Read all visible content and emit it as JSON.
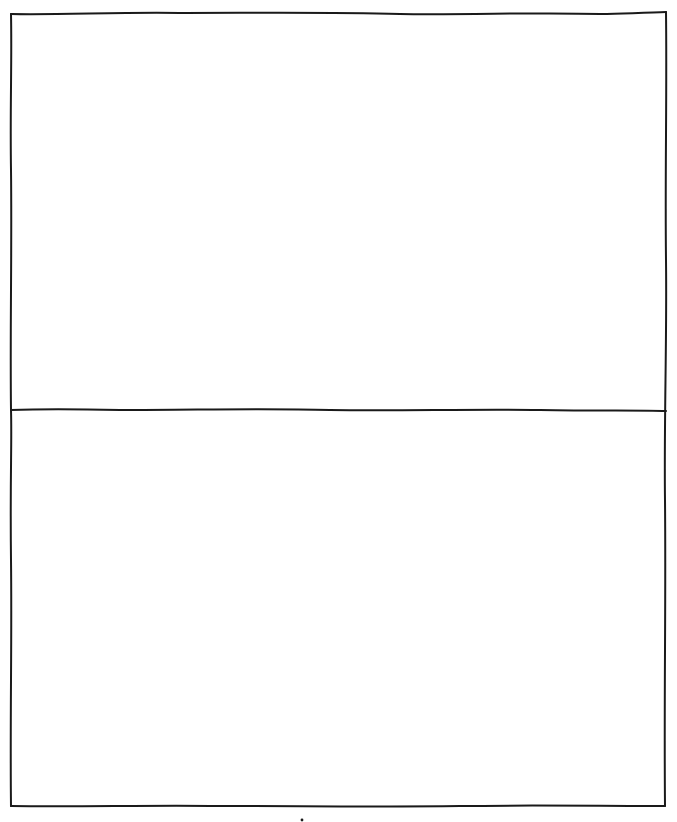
{
  "sketch": {
    "description": "Hand-drawn outline frame split into two empty stacked panels",
    "stroke_color": "#1a1a1a",
    "background_color": "#ffffff",
    "panels": [
      {
        "id": "top",
        "label": ""
      },
      {
        "id": "bottom",
        "label": ""
      }
    ],
    "marks": [
      {
        "type": "dot",
        "x": 302,
        "y": 820
      }
    ]
  }
}
